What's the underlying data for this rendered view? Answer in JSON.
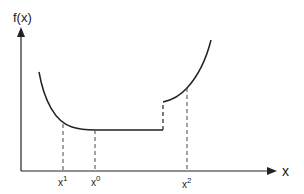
{
  "diagram": {
    "y_axis_label": "f(x)",
    "x_axis_label": "x",
    "tick_labels": {
      "x1": {
        "base": "x",
        "sup": "1"
      },
      "x0": {
        "base": "x",
        "sup": "0"
      },
      "x2": {
        "base": "x",
        "sup": "2"
      }
    },
    "colors": {
      "line": "#222222",
      "background": "#ffffff"
    }
  }
}
